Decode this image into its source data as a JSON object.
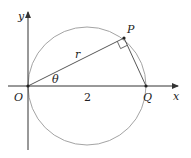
{
  "diagram": {
    "type": "polar-circle",
    "colors": {
      "axis": "#333333",
      "circle": "#999999",
      "line": "#444444",
      "text": "#222222"
    },
    "labels": {
      "y_axis": "y",
      "x_axis": "x",
      "origin": "O",
      "point_p": "P",
      "point_q": "Q",
      "radius": "r",
      "angle": "θ",
      "diameter": "2"
    },
    "points": {
      "O": [
        28,
        86
      ],
      "P": [
        124,
        38
      ],
      "Q": [
        146,
        86
      ]
    },
    "circle": {
      "cx": 87,
      "cy": 86,
      "r": 59
    },
    "right_angle_at": "P"
  }
}
